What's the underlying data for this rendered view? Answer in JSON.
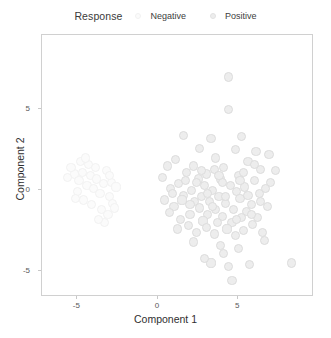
{
  "legend": {
    "title": "Response",
    "position": "top",
    "entries": [
      {
        "label": "Negative",
        "color": "#fbfbfb",
        "stroke": "#f2f2f2",
        "icon": "circle-marker"
      },
      {
        "label": "Positive",
        "color": "#ededed",
        "stroke": "#e2e2e2",
        "icon": "circle-marker"
      }
    ]
  },
  "axes": {
    "x": {
      "label": "Component 1",
      "ticks": [
        "-5",
        "0",
        "5"
      ],
      "tick_values": [
        -5,
        0,
        5
      ],
      "range": [
        -7.2,
        9.7
      ]
    },
    "y": {
      "label": "Component 2",
      "ticks": [
        "-5",
        "0",
        "5"
      ],
      "tick_values": [
        -5,
        0,
        5
      ],
      "range": [
        -6.6,
        9.6
      ]
    }
  },
  "style": {
    "panel_background": "#ffffff",
    "panel_border": "#d0d0d0",
    "tick_color": "#c8c8c8",
    "label_color": "#2f2f2f",
    "point_radius_px": 4.6
  },
  "chart_data": {
    "type": "scatter",
    "title": "",
    "xlabel": "Component 1",
    "ylabel": "Component 2",
    "xlim": [
      -7.2,
      9.7
    ],
    "ylim": [
      -6.6,
      9.6
    ],
    "grid": false,
    "legend_title": "Response",
    "legend_position": "top",
    "series": [
      {
        "name": "Negative",
        "color": "#fbfbfb",
        "stroke": "#f2f2f2",
        "points": [
          [
            -5.2,
            1.0
          ],
          [
            -4.9,
            0.6
          ],
          [
            -4.7,
            1.1
          ],
          [
            -4.4,
            0.3
          ],
          [
            -4.2,
            0.9
          ],
          [
            -4.0,
            0.1
          ],
          [
            -3.8,
            0.7
          ],
          [
            -3.6,
            -0.2
          ],
          [
            -3.4,
            0.4
          ],
          [
            -3.2,
            1.2
          ],
          [
            -3.0,
            -0.4
          ],
          [
            -2.9,
            0.5
          ],
          [
            -4.6,
            -0.6
          ],
          [
            -4.1,
            -0.9
          ],
          [
            -3.5,
            -1.2
          ],
          [
            -3.1,
            -1.5
          ],
          [
            -2.8,
            -0.8
          ],
          [
            -4.3,
            1.6
          ],
          [
            -3.9,
            1.4
          ],
          [
            -3.3,
            -2.0
          ],
          [
            -5.0,
            -0.1
          ],
          [
            -4.8,
            1.8
          ],
          [
            -2.7,
            -1.1
          ],
          [
            -3.7,
            -1.8
          ],
          [
            -5.4,
            1.4
          ],
          [
            -5.1,
            -0.5
          ],
          [
            -4.5,
            2.0
          ],
          [
            -3.0,
            0.9
          ],
          [
            -2.6,
            0.2
          ],
          [
            -5.6,
            0.8
          ]
        ]
      },
      {
        "name": "Positive",
        "color": "#ededed",
        "stroke": "#dcdcdc",
        "points": [
          [
            4.4,
            7.0
          ],
          [
            4.4,
            5.0
          ],
          [
            1.6,
            3.4
          ],
          [
            3.3,
            3.2
          ],
          [
            5.2,
            3.3
          ],
          [
            2.6,
            2.6
          ],
          [
            4.8,
            2.5
          ],
          [
            6.1,
            2.4
          ],
          [
            6.9,
            2.2
          ],
          [
            3.6,
            2.0
          ],
          [
            1.1,
            1.9
          ],
          [
            5.6,
            1.8
          ],
          [
            0.6,
            1.5
          ],
          [
            2.2,
            1.5
          ],
          [
            4.1,
            1.4
          ],
          [
            6.4,
            1.3
          ],
          [
            7.3,
            1.2
          ],
          [
            1.8,
            1.1
          ],
          [
            3.0,
            1.0
          ],
          [
            5.0,
            0.9
          ],
          [
            0.3,
            0.8
          ],
          [
            2.5,
            0.7
          ],
          [
            3.9,
            0.7
          ],
          [
            6.0,
            0.6
          ],
          [
            7.0,
            0.5
          ],
          [
            1.3,
            0.4
          ],
          [
            2.9,
            0.3
          ],
          [
            4.5,
            0.3
          ],
          [
            5.4,
            0.2
          ],
          [
            0.8,
            0.1
          ],
          [
            2.1,
            0.0
          ],
          [
            3.4,
            0.0
          ],
          [
            4.9,
            -0.1
          ],
          [
            6.3,
            -0.2
          ],
          [
            1.6,
            -0.3
          ],
          [
            2.7,
            -0.4
          ],
          [
            3.8,
            -0.4
          ],
          [
            5.1,
            -0.5
          ],
          [
            0.4,
            -0.6
          ],
          [
            2.3,
            -0.7
          ],
          [
            3.2,
            -0.7
          ],
          [
            4.2,
            -0.8
          ],
          [
            5.8,
            -0.9
          ],
          [
            6.8,
            -1.0
          ],
          [
            1.0,
            -1.0
          ],
          [
            2.6,
            -1.1
          ],
          [
            3.6,
            -1.2
          ],
          [
            4.7,
            -1.2
          ],
          [
            5.5,
            -1.3
          ],
          [
            0.7,
            -1.4
          ],
          [
            2.0,
            -1.5
          ],
          [
            3.1,
            -1.5
          ],
          [
            4.0,
            -1.6
          ],
          [
            5.2,
            -1.7
          ],
          [
            6.2,
            -1.7
          ],
          [
            1.4,
            -1.8
          ],
          [
            2.8,
            -1.9
          ],
          [
            3.7,
            -2.0
          ],
          [
            4.6,
            -2.0
          ],
          [
            5.9,
            -2.1
          ],
          [
            1.9,
            -2.2
          ],
          [
            3.0,
            -2.3
          ],
          [
            4.3,
            -2.4
          ],
          [
            5.3,
            -2.5
          ],
          [
            2.4,
            -2.6
          ],
          [
            3.5,
            -2.7
          ],
          [
            4.8,
            -2.8
          ],
          [
            6.5,
            -2.6
          ],
          [
            2.2,
            -3.2
          ],
          [
            3.9,
            -3.4
          ],
          [
            5.0,
            -3.6
          ],
          [
            4.1,
            -3.9
          ],
          [
            3.3,
            -4.5
          ],
          [
            4.4,
            -4.7
          ],
          [
            5.7,
            -4.6
          ],
          [
            8.3,
            -4.5
          ],
          [
            4.6,
            -5.6
          ],
          [
            2.9,
            -4.2
          ],
          [
            6.6,
            -3.1
          ],
          [
            1.2,
            -2.4
          ],
          [
            5.6,
            -0.3
          ],
          [
            2.4,
            0.5
          ],
          [
            4.2,
            -0.4
          ],
          [
            3.5,
            1.3
          ],
          [
            6.0,
            1.6
          ],
          [
            1.7,
            0.6
          ],
          [
            5.3,
            1.1
          ],
          [
            2.0,
            -0.9
          ],
          [
            4.0,
            0.5
          ],
          [
            3.1,
            -0.2
          ],
          [
            6.7,
            0.1
          ],
          [
            0.9,
            -0.2
          ],
          [
            5.8,
            -1.5
          ],
          [
            3.8,
            0.9
          ],
          [
            2.7,
            1.2
          ],
          [
            4.9,
            -1.8
          ],
          [
            1.5,
            -0.6
          ],
          [
            6.4,
            -0.7
          ],
          [
            3.4,
            -1.0
          ],
          [
            5.1,
            0.6
          ]
        ]
      }
    ]
  }
}
